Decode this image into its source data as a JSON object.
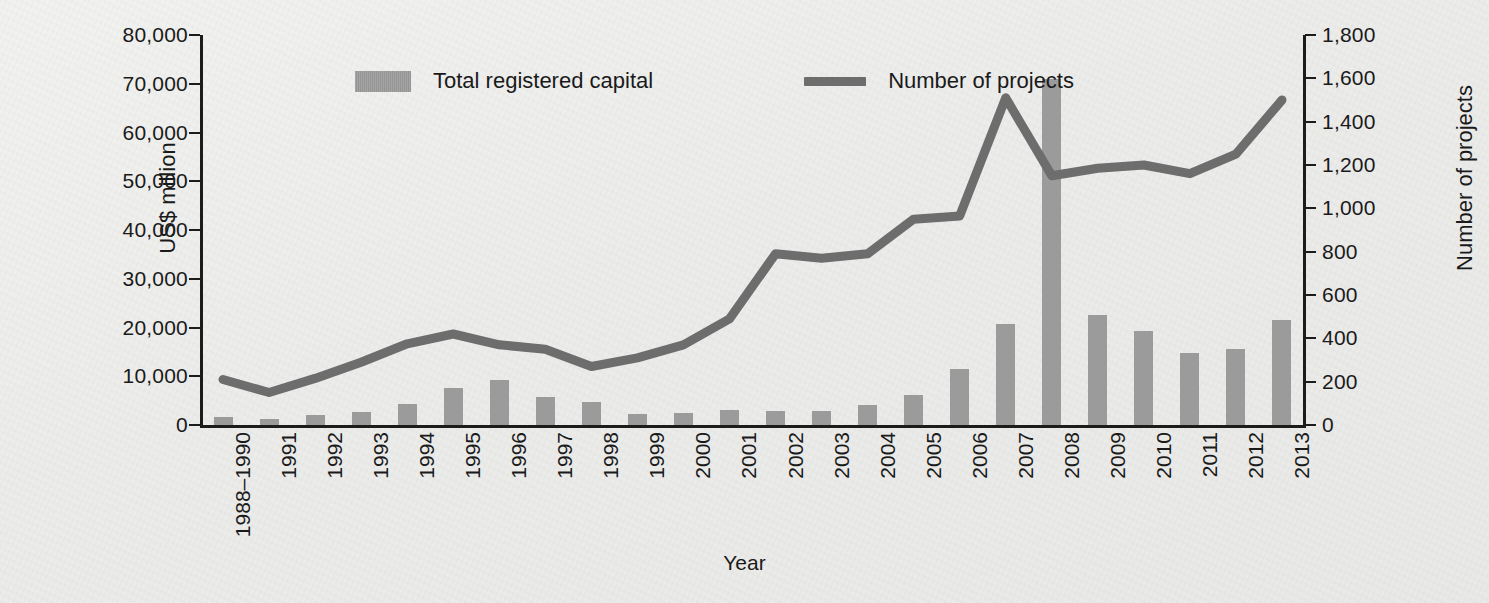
{
  "chart_data": {
    "type": "bar",
    "title": "",
    "xlabel": "Year",
    "ylabel": "US$ million",
    "y2label": "Number of projects",
    "grid": false,
    "legend_position": "top",
    "ylim": [
      0,
      80000
    ],
    "y2lim": [
      0,
      1800
    ],
    "yticks": [
      "0",
      "10,000",
      "20,000",
      "30,000",
      "40,000",
      "50,000",
      "60,000",
      "70,000",
      "80,000"
    ],
    "ytick_values": [
      0,
      10000,
      20000,
      30000,
      40000,
      50000,
      60000,
      70000,
      80000
    ],
    "y2ticks": [
      "0",
      "200",
      "400",
      "600",
      "800",
      "1,000",
      "1,200",
      "1,400",
      "1,600",
      "1,800"
    ],
    "y2tick_values": [
      0,
      200,
      400,
      600,
      800,
      1000,
      1200,
      1400,
      1600,
      1800
    ],
    "categories": [
      "1988–1990",
      "1991",
      "1992",
      "1993",
      "1994",
      "1995",
      "1996",
      "1997",
      "1998",
      "1999",
      "2000",
      "2001",
      "2002",
      "2003",
      "2004",
      "2005",
      "2006",
      "2007",
      "2008",
      "2009",
      "2010",
      "2011",
      "2012",
      "2013"
    ],
    "series": [
      {
        "name": "Total registered capital",
        "kind": "bar",
        "axis": "left",
        "unit": "US$ million",
        "color": "#9b9b9b",
        "values": [
          1600,
          1300,
          2000,
          2700,
          4300,
          7500,
          9200,
          5700,
          4700,
          2200,
          2500,
          3000,
          2800,
          2900,
          4200,
          6200,
          11400,
          20700,
          71000,
          22500,
          19200,
          14800,
          15600,
          21600
        ]
      },
      {
        "name": "Number of projects",
        "kind": "line",
        "axis": "right",
        "unit": "projects",
        "color": "#6d6d6d",
        "values": [
          210,
          150,
          215,
          290,
          375,
          420,
          370,
          350,
          270,
          310,
          370,
          490,
          790,
          770,
          790,
          950,
          965,
          1510,
          1150,
          1185,
          1200,
          1160,
          1250,
          1500
        ]
      }
    ]
  },
  "legend": {
    "items": [
      {
        "label": "Total registered capital",
        "marker": "bar-swatch"
      },
      {
        "label": "Number of projects",
        "marker": "line-swatch"
      }
    ]
  },
  "axes": {
    "left_title": "US$ million",
    "right_title": "Number of projects",
    "bottom_title": "Year"
  }
}
